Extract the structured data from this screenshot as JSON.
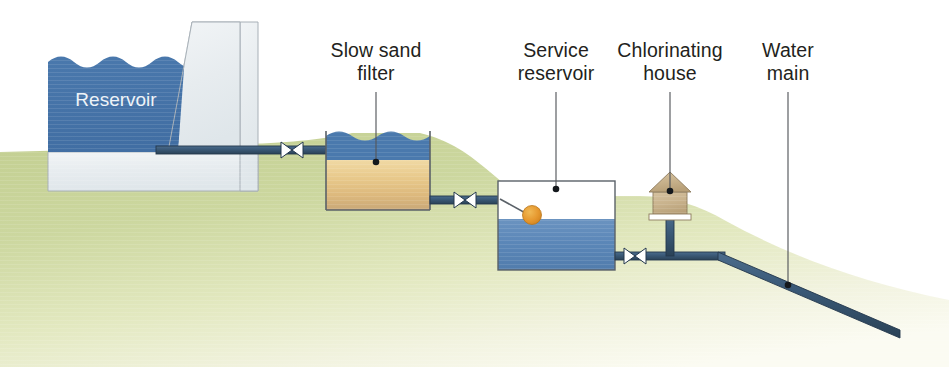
{
  "diagram": {
    "canvas": {
      "width": 949,
      "height": 367,
      "background": "#ffffff"
    },
    "palette": {
      "water_blue": "#4a79ad",
      "water_blue_dark": "#3f6ca1",
      "service_water_blue": "#5b87b8",
      "sand_tan": "#e8c98b",
      "sand_tan_dark": "#cfae79",
      "concrete_grey": "#e9edf0",
      "concrete_outline": "#9aa3ab",
      "ground_green": "#c9d49a",
      "ground_pale": "#f3f4df",
      "pipe_blue": "#3b5a78",
      "pipe_outline": "#24384d",
      "valve_white": "#ffffff",
      "float_orange": "#e6982f",
      "house_tan": "#cbb590",
      "label_text": "#231f20",
      "leader_grey": "#55585c"
    },
    "labels": [
      {
        "id": "reservoir",
        "name": "reservoir-label",
        "lines": [
          "Reservoir"
        ],
        "x": 116,
        "y": 106,
        "inside": true
      },
      {
        "id": "slow-sand-filter",
        "name": "slow-sand-filter-label",
        "lines": [
          "Slow sand",
          "filter"
        ],
        "x": 376,
        "y": 57,
        "leader": {
          "x1": 376,
          "y1": 72,
          "x2": 376,
          "y2": 160,
          "dot_x": 376,
          "dot_y": 163
        }
      },
      {
        "id": "service-reservoir",
        "name": "service-reservoir-label",
        "lines": [
          "Service",
          "reservoir"
        ],
        "x": 556,
        "y": 57,
        "leader": {
          "x1": 556,
          "y1": 72,
          "x2": 556,
          "y2": 186,
          "dot_x": 556,
          "dot_y": 189
        }
      },
      {
        "id": "chlorinating-house",
        "name": "chlorinating-house-label",
        "lines": [
          "Chlorinating",
          "house"
        ],
        "x": 670,
        "y": 57,
        "leader": {
          "x1": 670,
          "y1": 72,
          "x2": 670,
          "y2": 189,
          "dot_x": 670,
          "dot_y": 192
        }
      },
      {
        "id": "water-main",
        "name": "water-main-label",
        "lines": [
          "Water",
          "main"
        ],
        "x": 788,
        "y": 57,
        "leader": {
          "x1": 788,
          "y1": 72,
          "x2": 788,
          "y2": 283,
          "dot_x": 788,
          "dot_y": 286
        }
      }
    ],
    "components": [
      {
        "id": "dam",
        "name": "dam-structure",
        "type": "concrete"
      },
      {
        "id": "reservoir-water",
        "name": "reservoir-water-body",
        "type": "water"
      },
      {
        "id": "sand-filter",
        "name": "slow-sand-filter-tank",
        "type": "tank"
      },
      {
        "id": "service-tank",
        "name": "service-reservoir-tank",
        "type": "tank"
      },
      {
        "id": "chlorine-house",
        "name": "chlorinating-house",
        "type": "building"
      },
      {
        "id": "water-main-pipe",
        "name": "water-main-pipe",
        "type": "pipe"
      },
      {
        "id": "ball-float",
        "name": "ball-float-valve",
        "type": "valve"
      }
    ],
    "valves": [
      {
        "id": "valve-1",
        "name": "valve-reservoir-outlet",
        "x": 292,
        "y": 150
      },
      {
        "id": "valve-2",
        "name": "valve-filter-outlet",
        "x": 465,
        "y": 200
      },
      {
        "id": "valve-3",
        "name": "valve-service-res-outlet",
        "x": 635,
        "y": 256
      }
    ]
  }
}
